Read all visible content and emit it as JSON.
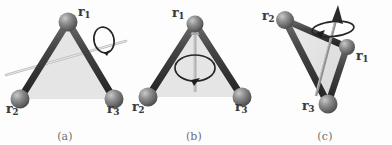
{
  "figure": {
    "kind": "three-panel physics diagram",
    "background_color": "#fdfdfd",
    "sphere_color": "#7d7d7d",
    "rod_color": "#3c3c3c",
    "face_color": "#e2e2e2",
    "axis_color": "#b9b9b9",
    "arrow_color": "#2e2e2e",
    "label_color": "#3a3a3a",
    "caption_color": "#6f6f6f"
  },
  "panels": [
    {
      "id": "a",
      "caption": "(a)",
      "axis_type": "in-plane axis through vertex r2 and midpoint of r1-r3 edge",
      "rotation_marker": "circular arrow near upper-right end of axis",
      "vertices": [
        {
          "name": "r1",
          "label": "r",
          "subscript": "1",
          "x": 68,
          "y": 22
        },
        {
          "name": "r2",
          "label": "r",
          "subscript": "2",
          "x": 20,
          "y": 99
        },
        {
          "name": "r3",
          "label": "r",
          "subscript": "3",
          "x": 114,
          "y": 99
        }
      ],
      "labels": [
        {
          "name": "vertex-label-r1",
          "text": "r",
          "sub": "1",
          "x": 78,
          "y": 8
        },
        {
          "name": "vertex-label-r2",
          "text": "r",
          "sub": "2",
          "x": 6,
          "y": 104
        },
        {
          "name": "vertex-label-r3",
          "text": "r",
          "sub": "3",
          "x": 108,
          "y": 104
        }
      ]
    },
    {
      "id": "b",
      "caption": "(b)",
      "axis_type": "in-plane vertical axis through vertex r1",
      "rotation_marker": "circular arrow around the vertical arrow shaft",
      "vertices": [
        {
          "name": "r1",
          "label": "r",
          "subscript": "1",
          "x": 65,
          "y": 24
        },
        {
          "name": "r2",
          "label": "r",
          "subscript": "2",
          "x": 18,
          "y": 97
        },
        {
          "name": "r3",
          "label": "r",
          "subscript": "3",
          "x": 112,
          "y": 97
        }
      ],
      "labels": [
        {
          "name": "vertex-label-r1",
          "text": "r",
          "sub": "1",
          "x": 42,
          "y": 9
        },
        {
          "name": "vertex-label-r2",
          "text": "r",
          "sub": "2",
          "x": 4,
          "y": 103
        },
        {
          "name": "vertex-label-r3",
          "text": "r",
          "sub": "3",
          "x": 106,
          "y": 103
        }
      ]
    },
    {
      "id": "c",
      "caption": "(c)",
      "axis_type": "axis perpendicular to the plane of the triangle",
      "rotation_marker": "circular arrow around the upward arrow near its tip",
      "vertices": [
        {
          "name": "r1",
          "label": "r",
          "subscript": "1",
          "x": 89,
          "y": 47
        },
        {
          "name": "r2",
          "label": "r",
          "subscript": "2",
          "x": 27,
          "y": 20
        },
        {
          "name": "r3",
          "label": "r",
          "subscript": "3",
          "x": 70,
          "y": 104
        }
      ],
      "labels": [
        {
          "name": "vertex-label-r1",
          "text": "r",
          "sub": "1",
          "x": 97,
          "y": 52
        },
        {
          "name": "vertex-label-r2",
          "text": "r",
          "sub": "2",
          "x": 6,
          "y": 12
        },
        {
          "name": "vertex-label-r3",
          "text": "r",
          "sub": "3",
          "x": 47,
          "y": 102
        }
      ]
    }
  ]
}
